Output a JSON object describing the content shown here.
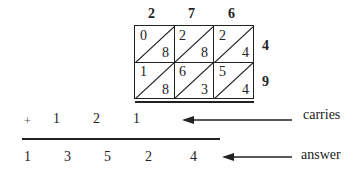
{
  "top_digits": [
    "2",
    "7",
    "6"
  ],
  "side_digits": [
    "4",
    "9"
  ],
  "cells": [
    [
      {
        "tens": "0",
        "ones": "8"
      },
      {
        "tens": "2",
        "ones": "8"
      },
      {
        "tens": "2",
        "ones": "4"
      }
    ],
    [
      {
        "tens": "1",
        "ones": "8"
      },
      {
        "tens": "6",
        "ones": "3"
      },
      {
        "tens": "5",
        "ones": "4"
      }
    ]
  ],
  "carries": {
    "plus": "+",
    "digits": [
      "1",
      "2",
      "1"
    ],
    "label": "carries"
  },
  "answer": {
    "digits": [
      "1",
      "3",
      "5",
      "2",
      "4"
    ],
    "label": "answer"
  }
}
